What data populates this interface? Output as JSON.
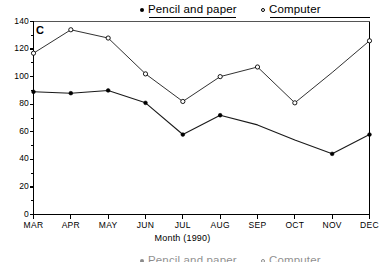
{
  "panel": {
    "label": "C"
  },
  "legend": {
    "position": "top",
    "entries": [
      {
        "marker": "filled-dot-marker",
        "label": "Pencil and paper"
      },
      {
        "marker": "open-circle-marker",
        "label": "Computer"
      }
    ]
  },
  "legend_bottom": {
    "entries": [
      {
        "marker": "filled-dot-marker",
        "label": "Pencil and paper"
      },
      {
        "marker": "open-circle-marker",
        "label": "Computer"
      }
    ]
  },
  "axes": {
    "x_title": "Month (1990)",
    "y_ticks": [
      "0",
      "20",
      "40",
      "60",
      "80",
      "100",
      "120",
      "140"
    ],
    "x_ticks": [
      "MAR",
      "APR",
      "MAY",
      "JUN",
      "JUL",
      "AUG",
      "SEP",
      "OCT",
      "NOV",
      "DEC"
    ]
  },
  "colors": {
    "line": "#1a1a1a",
    "axis": "#000000",
    "background": "#ffffff"
  },
  "chart_data": {
    "type": "line",
    "title": "",
    "subtitle": "",
    "panel_label": "C",
    "xlabel": "Month (1990)",
    "ylabel": "",
    "categories": [
      "MAR",
      "APR",
      "MAY",
      "JUN",
      "JUL",
      "AUG",
      "SEP",
      "OCT",
      "NOV",
      "DEC"
    ],
    "x": [
      "MAR",
      "APR",
      "MAY",
      "JUN",
      "JUL",
      "AUG",
      "SEP",
      "OCT",
      "NOV",
      "DEC"
    ],
    "ylim": [
      0,
      140
    ],
    "yticks": [
      0,
      20,
      40,
      60,
      80,
      100,
      120,
      140
    ],
    "grid": false,
    "legend_position": "top",
    "series": [
      {
        "name": "Pencil and paper",
        "marker": "filled-circle",
        "values": [
          89,
          88,
          90,
          81,
          58,
          72,
          65,
          54,
          44,
          58
        ]
      },
      {
        "name": "Computer",
        "marker": "open-circle",
        "values": [
          117,
          134,
          128,
          102,
          82,
          100,
          107,
          81,
          103,
          126
        ]
      }
    ]
  }
}
